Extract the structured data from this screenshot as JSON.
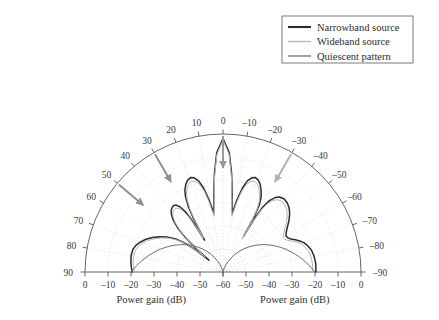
{
  "legend": {
    "position": "top-right",
    "box": {
      "x": 282,
      "y": 16,
      "w": 131,
      "h": 47
    },
    "entries": [
      {
        "label": "Narrowband source",
        "color": "#2b2b2b",
        "width": 2.1
      },
      {
        "label": "Wideband source",
        "color": "#b5b5b5",
        "width": 1.3
      },
      {
        "label": "Quiescent pattern",
        "color": "#6e6e6e",
        "width": 1.3
      }
    ]
  },
  "axes": {
    "left_title": "Power gain (dB)",
    "right_title": "Power gain (dB)",
    "angle_unit": "deg",
    "angle_labels_left": [
      "90",
      "80",
      "70",
      "60",
      "50",
      "40",
      "30",
      "20",
      "10",
      "0"
    ],
    "angle_labels_right": [
      "–10",
      "–20",
      "–30",
      "–40",
      "–50",
      "–60",
      "–70",
      "–80",
      "–90"
    ],
    "radial_labels_left": [
      "0",
      "–10",
      "–20",
      "–30",
      "–40",
      "–50",
      "–60"
    ],
    "radial_labels_right": [
      "–50",
      "–40",
      "–30",
      "–20",
      "–10",
      "0"
    ],
    "radial_center_label": "–60"
  },
  "annotations": [
    {
      "name": "arrow-interferer-30",
      "color": "#8f8f8f",
      "angle_deg": 30
    },
    {
      "name": "arrow-interferer-50",
      "color": "#8f8f8f",
      "angle_deg": 50
    },
    {
      "name": "arrow-desired-0",
      "color": "#9a9a9a",
      "angle_deg": 0
    },
    {
      "name": "arrow-interferer-minus30",
      "color": "#b0b0b0",
      "angle_deg": -30
    }
  ],
  "chart_data": {
    "type": "line",
    "plot_style": "polar-half",
    "title": "",
    "xlabel": "Power gain (dB)",
    "ylabel": "",
    "angle_range_deg": [
      -90,
      90
    ],
    "angle_ticks_deg": [
      90,
      80,
      70,
      60,
      50,
      40,
      30,
      20,
      10,
      0,
      -10,
      -20,
      -30,
      -40,
      -50,
      -60,
      -70,
      -80,
      -90
    ],
    "radial_range_db": [
      -60,
      0
    ],
    "radial_ticks_db": [
      0,
      -10,
      -20,
      -30,
      -40,
      -50,
      -60
    ],
    "grid": true,
    "legend_position": "upper right",
    "nulls_deg": [
      50,
      30,
      -30
    ],
    "mainbeam_deg": 0,
    "series": [
      {
        "name": "Narrowband source",
        "color": "#2b2b2b",
        "linewidth": 1.5,
        "angles_deg": [
          90,
          85,
          80,
          76,
          73,
          70,
          67,
          64,
          61,
          58,
          55,
          52.5,
          51,
          50,
          49,
          47.5,
          46,
          44,
          42,
          40,
          38,
          36.5,
          35,
          33.5,
          32,
          31,
          30,
          29,
          28,
          26.5,
          25,
          23,
          21,
          19,
          17,
          15,
          13,
          11,
          9,
          7,
          5,
          3,
          0,
          -3,
          -5,
          -7,
          -9,
          -11,
          -13,
          -15,
          -17,
          -19,
          -21,
          -23,
          -25,
          -27,
          -28.5,
          -29.5,
          -30,
          -30.5,
          -31.5,
          -33,
          -35,
          -37,
          -40,
          -43,
          -46,
          -49,
          -52,
          -55,
          -58,
          -60,
          -62,
          -64,
          -66,
          -68,
          -70,
          -73,
          -76,
          -80,
          -85,
          -90
        ],
        "values_db": [
          -20.5,
          -19.8,
          -19.4,
          -19.6,
          -20.4,
          -21.8,
          -23.6,
          -25.8,
          -28.3,
          -31.2,
          -35.0,
          -40.0,
          -45.0,
          -52.0,
          -45.0,
          -38.0,
          -33.0,
          -29.0,
          -26.5,
          -25.0,
          -24.2,
          -24.0,
          -24.5,
          -26.0,
          -29.0,
          -34.0,
          -44.0,
          -34.0,
          -28.0,
          -23.5,
          -20.8,
          -18.6,
          -17.2,
          -16.6,
          -17.2,
          -19.0,
          -22.5,
          -28.0,
          -34.0,
          -27.0,
          -17.0,
          -8.0,
          -2.0,
          -8.0,
          -17.0,
          -27.0,
          -34.0,
          -28.0,
          -22.5,
          -19.0,
          -17.2,
          -16.6,
          -17.2,
          -18.6,
          -20.8,
          -23.5,
          -27.0,
          -33.0,
          -42.0,
          -33.0,
          -27.0,
          -23.0,
          -20.5,
          -19.2,
          -18.6,
          -19.0,
          -20.0,
          -21.6,
          -23.6,
          -25.8,
          -27.6,
          -28.4,
          -28.2,
          -27.2,
          -25.6,
          -24.0,
          -22.6,
          -21.4,
          -20.4,
          -19.8,
          -19.5,
          -19.6
        ]
      },
      {
        "name": "Wideband source",
        "color": "#b5b5b5",
        "linewidth": 1.0,
        "angles_deg": [
          90,
          85,
          80,
          76,
          73,
          70,
          67,
          64,
          61,
          58,
          55,
          52.5,
          51,
          50,
          49,
          47.5,
          46,
          44,
          42,
          40,
          38,
          36.5,
          35,
          33.5,
          32,
          31,
          30,
          29,
          28,
          26.5,
          25,
          23,
          21,
          19,
          17,
          15,
          13,
          11,
          9,
          7,
          5,
          3,
          0,
          -3,
          -5,
          -7,
          -9,
          -11,
          -13,
          -15,
          -17,
          -19,
          -21,
          -23,
          -25,
          -27,
          -28.5,
          -29.5,
          -30,
          -30.5,
          -31.5,
          -33,
          -35,
          -37,
          -40,
          -43,
          -46,
          -49,
          -52,
          -55,
          -58,
          -60,
          -62,
          -64,
          -66,
          -68,
          -70,
          -73,
          -76,
          -80,
          -85,
          -90
        ],
        "values_db": [
          -21.5,
          -20.8,
          -20.5,
          -20.8,
          -21.6,
          -23.0,
          -24.8,
          -27.0,
          -29.4,
          -32.2,
          -35.8,
          -40.6,
          -45.5,
          -50.0,
          -45.5,
          -39.0,
          -34.0,
          -30.0,
          -27.5,
          -26.2,
          -25.6,
          -25.5,
          -26.2,
          -27.8,
          -31.0,
          -36.0,
          -43.0,
          -36.0,
          -30.0,
          -25.2,
          -22.5,
          -20.2,
          -18.8,
          -18.2,
          -18.8,
          -20.6,
          -24.0,
          -29.5,
          -35.5,
          -28.0,
          -18.0,
          -8.8,
          -2.6,
          -8.8,
          -18.0,
          -28.0,
          -35.5,
          -29.5,
          -24.0,
          -20.6,
          -18.8,
          -18.2,
          -18.8,
          -20.2,
          -22.5,
          -25.2,
          -28.6,
          -34.5,
          -43.5,
          -34.5,
          -28.6,
          -24.6,
          -22.0,
          -20.6,
          -20.0,
          -20.4,
          -21.4,
          -23.0,
          -25.0,
          -27.2,
          -29.0,
          -29.8,
          -29.6,
          -28.6,
          -27.0,
          -25.4,
          -24.0,
          -22.8,
          -21.8,
          -21.2,
          -20.9,
          -21.0
        ]
      },
      {
        "name": "Quiescent pattern",
        "color": "#6e6e6e",
        "linewidth": 1.0,
        "angles_deg": [
          90,
          86,
          82,
          78,
          74,
          70,
          66,
          62,
          58,
          54,
          50,
          46,
          42,
          38,
          34,
          30,
          26,
          22,
          18,
          14,
          10,
          6,
          3,
          0
        ],
        "values_db": [
          -20.0,
          -22.2,
          -24.4,
          -26.6,
          -28.8,
          -31.0,
          -33.2,
          -35.4,
          -37.6,
          -39.8,
          -42.0,
          -44.2,
          -46.4,
          -48.6,
          -50.8,
          -53.0,
          -55.0,
          -56.6,
          -58.0,
          -59.0,
          -59.6,
          -60.0,
          -60.0,
          -60.0
        ]
      }
    ]
  },
  "geometry": {
    "center_x": 223,
    "center_y": 272,
    "radius": 138
  }
}
